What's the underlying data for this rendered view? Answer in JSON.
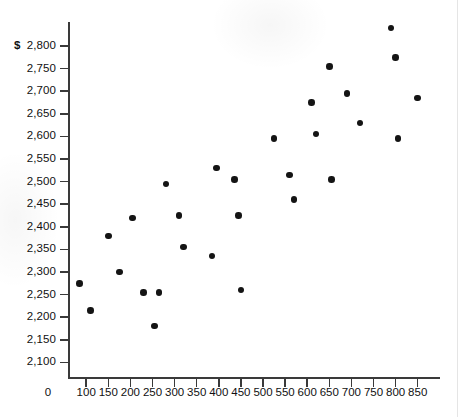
{
  "chart_data": {
    "type": "scatter",
    "title": "",
    "xlabel": "",
    "ylabel": "",
    "currency_symbol": "$",
    "xlim": [
      0,
      875
    ],
    "ylim": [
      2075,
      2865
    ],
    "grid": false,
    "legend": "none",
    "x_ticks": [
      0,
      100,
      150,
      200,
      250,
      300,
      350,
      400,
      450,
      500,
      550,
      600,
      650,
      700,
      750,
      800,
      850
    ],
    "x_tick_labels": [
      "0",
      "100",
      "150",
      "200",
      "250",
      "300",
      "350",
      "400",
      "450",
      "500",
      "550",
      "600",
      "650",
      "700",
      "750",
      "800",
      "850"
    ],
    "y_ticks": [
      2100,
      2150,
      2200,
      2250,
      2300,
      2350,
      2400,
      2450,
      2500,
      2550,
      2600,
      2650,
      2700,
      2750,
      2800
    ],
    "y_tick_labels": [
      "2,100",
      "2,150",
      "2,200",
      "2,250",
      "2,300",
      "2,350",
      "2,400",
      "2,450",
      "2,500",
      "2,550",
      "2,600",
      "2,650",
      "2,700",
      "2,750",
      "2,800"
    ],
    "points": [
      {
        "x": 85,
        "y": 2275
      },
      {
        "x": 110,
        "y": 2215
      },
      {
        "x": 150,
        "y": 2380
      },
      {
        "x": 175,
        "y": 2300
      },
      {
        "x": 205,
        "y": 2420
      },
      {
        "x": 230,
        "y": 2255
      },
      {
        "x": 255,
        "y": 2180
      },
      {
        "x": 265,
        "y": 2255
      },
      {
        "x": 280,
        "y": 2495
      },
      {
        "x": 310,
        "y": 2425
      },
      {
        "x": 320,
        "y": 2355
      },
      {
        "x": 385,
        "y": 2335
      },
      {
        "x": 395,
        "y": 2530
      },
      {
        "x": 435,
        "y": 2505
      },
      {
        "x": 445,
        "y": 2425
      },
      {
        "x": 450,
        "y": 2260
      },
      {
        "x": 525,
        "y": 2595
      },
      {
        "x": 560,
        "y": 2515
      },
      {
        "x": 570,
        "y": 2460
      },
      {
        "x": 610,
        "y": 2675
      },
      {
        "x": 620,
        "y": 2605
      },
      {
        "x": 650,
        "y": 2755
      },
      {
        "x": 655,
        "y": 2505
      },
      {
        "x": 690,
        "y": 2695
      },
      {
        "x": 720,
        "y": 2630
      },
      {
        "x": 790,
        "y": 2840
      },
      {
        "x": 800,
        "y": 2775
      },
      {
        "x": 805,
        "y": 2595
      },
      {
        "x": 850,
        "y": 2685
      }
    ]
  }
}
